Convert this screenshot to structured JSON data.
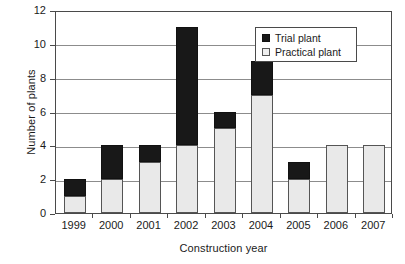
{
  "chart_data": {
    "type": "bar",
    "title": "",
    "subtitle": "",
    "xlabel": "Construction year",
    "ylabel": "Number of plants",
    "categories": [
      "1999",
      "2000",
      "2001",
      "2002",
      "2003",
      "2004",
      "2005",
      "2006",
      "2007"
    ],
    "series": [
      {
        "name": "Practical plant",
        "color": "#e9e9e9",
        "values": [
          1,
          2,
          3,
          4,
          5,
          7,
          2,
          4,
          4
        ]
      },
      {
        "name": "Trial plant",
        "color": "#181818",
        "values": [
          1,
          2,
          1,
          7,
          1,
          2,
          1,
          0,
          0
        ]
      }
    ],
    "totals": [
      2,
      4,
      4,
      11,
      6,
      9,
      3,
      4,
      4
    ],
    "stacked": true,
    "ylim": [
      0,
      12
    ],
    "yticks": [
      0,
      2,
      4,
      6,
      8,
      10,
      12
    ],
    "ytick_labels": [
      "0",
      "2",
      "4",
      "6",
      "8",
      "10",
      "12"
    ],
    "grid": true,
    "grid_axis": "y",
    "legend_position": "top-right",
    "legend_entries": [
      "Trial plant",
      "Practical plant"
    ]
  },
  "legend": {
    "entries": [
      {
        "label": "Trial plant",
        "swatch": "trial-swatch"
      },
      {
        "label": "Practical plant",
        "swatch": "practical-swatch"
      }
    ]
  },
  "axes": {
    "y_title": "Number of plants",
    "x_title": "Construction year"
  }
}
